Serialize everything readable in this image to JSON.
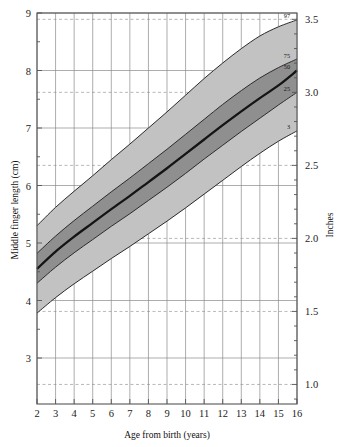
{
  "chart_data": {
    "type": "line",
    "title": "",
    "xlabel": "Age from birth (years)",
    "ylabel": "Middle finger length (cm)",
    "y2label": "Inches",
    "xlim": [
      2,
      16
    ],
    "ylim": [
      3,
      9
    ],
    "y2lim": [
      0.85,
      3.6
    ],
    "grid": true,
    "legend_position": "right-edge-inline",
    "x_ticks": [
      "2",
      "3",
      "4",
      "5",
      "6",
      "7",
      "8",
      "9",
      "10",
      "11",
      "12",
      "13",
      "14",
      "15",
      "16"
    ],
    "y_ticks": [
      "3",
      "4",
      "5",
      "6",
      "7",
      "8",
      "9"
    ],
    "y2_ticks": [
      "1.0",
      "1.5",
      "2.0",
      "2.5",
      "3.0",
      "3.5"
    ],
    "x": [
      2,
      3,
      4,
      5,
      6,
      7,
      8,
      9,
      10,
      11,
      12,
      13,
      14,
      15,
      16
    ],
    "series": [
      {
        "name": "97",
        "label": "97",
        "values": [
          5.3,
          5.62,
          5.9,
          6.17,
          6.45,
          6.72,
          7.0,
          7.28,
          7.57,
          7.86,
          8.13,
          8.38,
          8.6,
          8.76,
          8.88
        ]
      },
      {
        "name": "75",
        "label": "75",
        "values": [
          4.82,
          5.12,
          5.39,
          5.64,
          5.89,
          6.13,
          6.38,
          6.63,
          6.89,
          7.15,
          7.41,
          7.65,
          7.87,
          8.05,
          8.2
        ]
      },
      {
        "name": "50",
        "label": "50",
        "values": [
          4.55,
          4.85,
          5.11,
          5.35,
          5.59,
          5.82,
          6.06,
          6.3,
          6.55,
          6.8,
          7.05,
          7.29,
          7.52,
          7.74,
          8.0
        ]
      },
      {
        "name": "25",
        "label": "25",
        "values": [
          4.3,
          4.58,
          4.83,
          5.06,
          5.29,
          5.51,
          5.74,
          5.97,
          6.21,
          6.46,
          6.7,
          6.94,
          7.17,
          7.4,
          7.62
        ]
      },
      {
        "name": "3",
        "label": "3",
        "values": [
          3.78,
          4.05,
          4.29,
          4.51,
          4.73,
          4.94,
          5.16,
          5.38,
          5.61,
          5.85,
          6.09,
          6.33,
          6.56,
          6.77,
          6.95
        ]
      }
    ],
    "bands": [
      {
        "name": "3-97 band",
        "lower": "3",
        "upper": "97",
        "color": "#c2c2c2"
      },
      {
        "name": "25-75 band",
        "lower": "25",
        "upper": "75",
        "color": "#8f8f8f"
      }
    ],
    "median_series": "50",
    "percentile_edge_labels": [
      "97",
      "75",
      "50",
      "25",
      "3"
    ]
  },
  "axes": {
    "left": {
      "title": "Middle finger length (cm)",
      "ticks": [
        "9",
        "8",
        "7",
        "6",
        "5",
        "4",
        "3"
      ]
    },
    "right": {
      "title": "Inches",
      "ticks": [
        "3.5",
        "3.0",
        "2.5",
        "2.0",
        "1.5",
        "1.0"
      ]
    },
    "bottom": {
      "title": "Age from birth (years)",
      "ticks": [
        "2",
        "3",
        "4",
        "5",
        "6",
        "7",
        "8",
        "9",
        "10",
        "11",
        "12",
        "13",
        "14",
        "15",
        "16"
      ]
    }
  },
  "colors": {
    "band_outer": "#c2c2c2",
    "band_inner": "#8f8f8f",
    "median_line": "#141414",
    "curve_line": "#2b2b2b",
    "grid_major": "#8a8a8a",
    "grid_inch": "#9a9a9a",
    "axis": "#555555",
    "background": "#ffffff"
  }
}
